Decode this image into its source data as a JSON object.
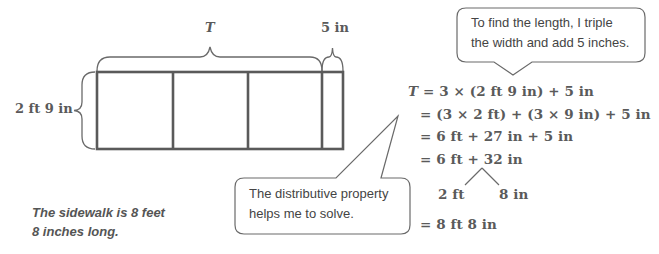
{
  "diagram": {
    "tape": {
      "total_label": "T",
      "extra_label": "5 in",
      "width_label": "2 ft 9 in",
      "segments": 3,
      "extra_segments": 1
    },
    "callouts": {
      "top": {
        "line1": "To find the length, I triple",
        "line2": "the width and add 5 inches."
      },
      "bottom": {
        "line1": "The distributive property",
        "line2": "helps me to solve."
      }
    },
    "equations": {
      "line1_var": "T",
      "line1_rest": " = 3 × (2 ft 9 in) + 5 in",
      "line2": "= (3 × 2 ft) + (3 × 9 in) + 5 in",
      "line3": "= 6 ft + 27 in + 5 in",
      "line4": "= 6 ft + 32 in",
      "split_left": "2 ft",
      "split_right": "8 in",
      "line5": "= 8 ft 8 in"
    },
    "answer": {
      "line1": "The sidewalk is 8 feet",
      "line2": "8 inches long."
    },
    "colors": {
      "stroke": "#5a5a5a",
      "text": "#555555",
      "background": "#ffffff"
    }
  }
}
